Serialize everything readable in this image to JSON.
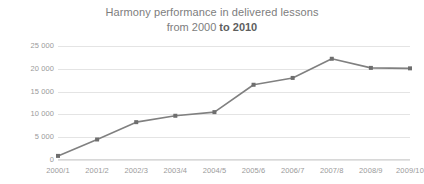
{
  "chart_data": {
    "type": "line",
    "title": "Harmony performance in delivered lessons from 2000 to 2010",
    "title_line_1": "Harmony performance in delivered lessons",
    "title_line_2_prefix": "from 2000 ",
    "title_line_2_strong": "to 2010",
    "xlabel": "",
    "ylabel": "",
    "categories": [
      "2000/1",
      "2001/2",
      "2002/3",
      "2003/4",
      "2004/5",
      "2005/6",
      "2006/7",
      "2007/8",
      "2008/9",
      "2009/10"
    ],
    "values": [
      900,
      4500,
      8300,
      9700,
      10500,
      16500,
      18000,
      22200,
      20200,
      20100
    ],
    "ylim": [
      0,
      25000
    ],
    "ytick_values": [
      0,
      5000,
      10000,
      15000,
      20000,
      25000
    ],
    "ytick_labels": [
      "0",
      "5 000",
      "10 000",
      "15 000",
      "20 000",
      "25 000"
    ],
    "grid": true,
    "legend": false,
    "series_color": "#808080",
    "marker_color": "#6e6e6e",
    "gridline_color": "#e4e4e4",
    "text_color": "#9a9a9a",
    "title_color": "#7d7d7d",
    "background": "#ffffff"
  }
}
